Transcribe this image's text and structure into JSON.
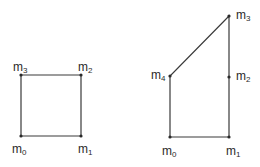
{
  "colors": {
    "line": "#3a3a3a",
    "text": "#2a2a2a",
    "background": "#ffffff"
  },
  "figures": [
    {
      "name": "square",
      "vertices": [
        {
          "label": "m",
          "sub": "0",
          "x": 21,
          "y": 136
        },
        {
          "label": "m",
          "sub": "1",
          "x": 81,
          "y": 136
        },
        {
          "label": "m",
          "sub": "2",
          "x": 81,
          "y": 75
        },
        {
          "label": "m",
          "sub": "3",
          "x": 21,
          "y": 75
        }
      ]
    },
    {
      "name": "pentagon",
      "vertices": [
        {
          "label": "m",
          "sub": "0",
          "x": 170,
          "y": 137
        },
        {
          "label": "m",
          "sub": "1",
          "x": 229,
          "y": 137
        },
        {
          "label": "m",
          "sub": "2",
          "x": 229,
          "y": 77
        },
        {
          "label": "m",
          "sub": "3",
          "x": 229,
          "y": 16
        },
        {
          "label": "m",
          "sub": "4",
          "x": 170,
          "y": 76
        }
      ]
    }
  ]
}
